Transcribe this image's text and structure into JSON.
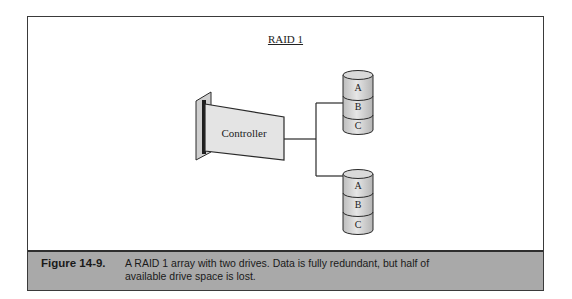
{
  "diagram": {
    "title": "RAID 1",
    "controller": {
      "label": "Controller"
    },
    "drives": [
      {
        "id": "drive-1",
        "segments": [
          "A",
          "B",
          "C"
        ]
      },
      {
        "id": "drive-2",
        "segments": [
          "A",
          "B",
          "C"
        ]
      }
    ],
    "colors": {
      "fill": "#d6d6d6",
      "card_fill": "#e4e4e4",
      "stroke": "#2a2a2a",
      "caption_bg": "#a9a9a9"
    }
  },
  "caption": {
    "label": "Figure 14-9.",
    "text": "A RAID 1 array with two drives. Data is fully redundant, but half of available drive space is lost."
  }
}
